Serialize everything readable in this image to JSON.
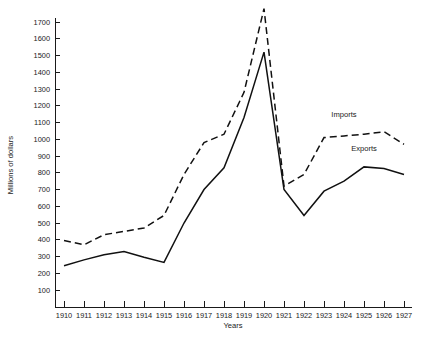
{
  "chart_data": {
    "type": "line",
    "title": "",
    "xlabel": "Years",
    "ylabel": "Millions of dollars",
    "xlim": [
      1910,
      1927
    ],
    "ylim": [
      0,
      1780
    ],
    "grid": false,
    "legend_position": "inline-annotation",
    "x": [
      1910,
      1911,
      1912,
      1913,
      1914,
      1915,
      1916,
      1917,
      1918,
      1919,
      1920,
      1921,
      1922,
      1923,
      1924,
      1925,
      1926,
      1927
    ],
    "xtick_labels": [
      "1910",
      "1911",
      "1912",
      "1913",
      "1914",
      "1915",
      "1916",
      "1917",
      "1918",
      "1919",
      "1920",
      "1921",
      "1922",
      "1923",
      "1924",
      "1925",
      "1926",
      "1927"
    ],
    "ytick_values": [
      100,
      200,
      300,
      400,
      500,
      600,
      700,
      800,
      900,
      1000,
      1100,
      1200,
      1300,
      1400,
      1500,
      1600,
      1700
    ],
    "ytick_labels": [
      "100",
      "200",
      "300",
      "400",
      "500",
      "600",
      "700",
      "800",
      "900",
      "1000",
      "1100",
      "1200",
      "1300",
      "1400",
      "1500",
      "1600",
      "1700"
    ],
    "series": [
      {
        "name": "Imports",
        "style": "dashed",
        "color": "#111111",
        "values": [
          395,
          370,
          430,
          450,
          470,
          545,
          790,
          980,
          1030,
          1280,
          1780,
          720,
          790,
          1010,
          1020,
          1030,
          1045,
          970
        ]
      },
      {
        "name": "Exports",
        "style": "solid",
        "color": "#111111",
        "values": [
          245,
          280,
          310,
          330,
          295,
          265,
          500,
          700,
          830,
          1130,
          1520,
          700,
          545,
          690,
          750,
          835,
          825,
          790
        ]
      }
    ],
    "annotations": [
      {
        "text": "Imports",
        "x": 1924,
        "y": 1130
      },
      {
        "text": "Exports",
        "x": 1925,
        "y": 930
      }
    ]
  }
}
